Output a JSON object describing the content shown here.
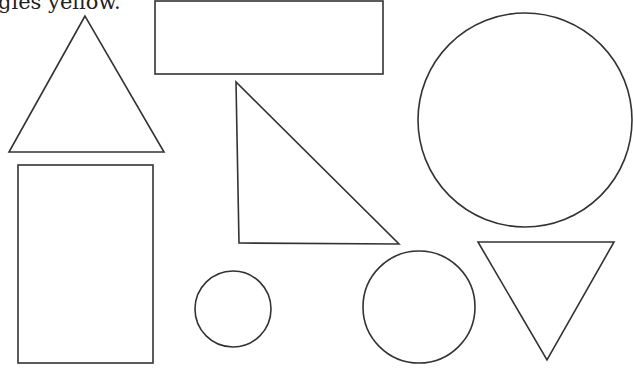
{
  "worksheet": {
    "instruction_text": "gles yellow.",
    "stroke_color": "#333333",
    "fill_color": "#ffffff"
  },
  "shapes": [
    {
      "id": "triangle-upright",
      "type": "triangle",
      "points": "85,16 9,152 164,152"
    },
    {
      "id": "rectangle-wide",
      "type": "rectangle",
      "x": 155,
      "y": 1,
      "width": 228,
      "height": 73
    },
    {
      "id": "triangle-right",
      "type": "triangle",
      "points": "236,82 239,243 399,244"
    },
    {
      "id": "circle-large",
      "type": "circle",
      "cx": 525,
      "cy": 120,
      "r": 107
    },
    {
      "id": "rectangle-tall",
      "type": "rectangle",
      "x": 18,
      "y": 165,
      "width": 135,
      "height": 198
    },
    {
      "id": "circle-small",
      "type": "circle",
      "cx": 233,
      "cy": 309,
      "r": 38
    },
    {
      "id": "circle-medium",
      "type": "circle",
      "cx": 419,
      "cy": 307,
      "r": 56
    },
    {
      "id": "triangle-inverted",
      "type": "triangle",
      "points": "478,242 614,242 547,360"
    }
  ]
}
